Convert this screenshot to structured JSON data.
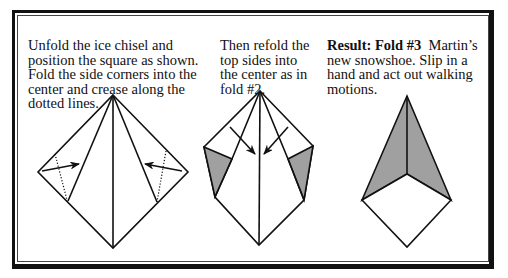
{
  "panels": [
    {
      "id": "step-unfold",
      "text": "Unfold the ice chisel and position the square as shown. Fold the side corners into the center and crease along the dotted lines."
    },
    {
      "id": "step-refold",
      "text": "Then refold the top sides into the center as in fold #2."
    },
    {
      "id": "step-result",
      "heading": "Result: Fold #3",
      "text": "Martin’s new snowshoe. Slip in a hand and act out walking motions."
    }
  ],
  "colors": {
    "line": "#111111",
    "shade": "#a0a0a0",
    "background": "#ffffff"
  },
  "icons": [
    "fold-arrow-icon",
    "dotted-crease-line"
  ]
}
